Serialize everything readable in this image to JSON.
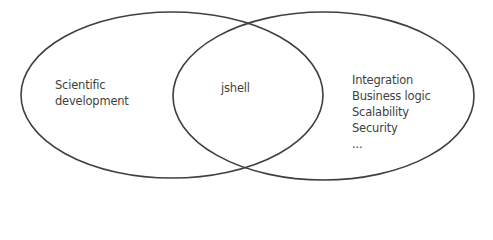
{
  "diagram": {
    "type": "venn",
    "stroke_color": "#404040",
    "text_color": "#3f3f3f",
    "sets": [
      {
        "name": "left",
        "label_lines": [
          "Scientific",
          "development"
        ]
      },
      {
        "name": "right",
        "items": [
          "Integration",
          "Business logic",
          "Scalability",
          "Security",
          "..."
        ]
      }
    ],
    "intersection": {
      "label": "jshell"
    }
  }
}
